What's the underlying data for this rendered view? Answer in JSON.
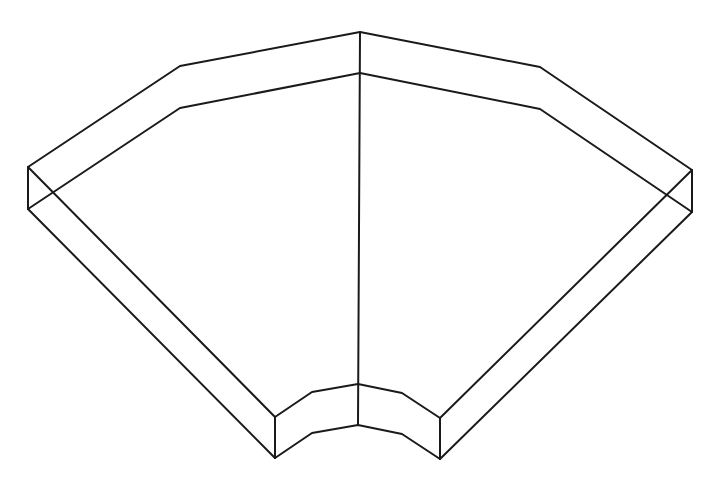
{
  "diagram": {
    "title": "",
    "stroke_color": "#1a1a1a",
    "background": "#ffffff",
    "edges": {
      "outer_top": [
        [
          28,
          167
        ],
        [
          180,
          66
        ],
        [
          360,
          32
        ],
        [
          540,
          67
        ],
        [
          692,
          170
        ]
      ],
      "outer_bottom": [
        [
          28,
          209
        ],
        [
          180,
          108
        ],
        [
          360,
          73
        ],
        [
          540,
          109
        ],
        [
          692,
          212
        ]
      ],
      "inner_top": [
        [
          275,
          417
        ],
        [
          312,
          392
        ],
        [
          358,
          384
        ],
        [
          402,
          393
        ],
        [
          440,
          418
        ]
      ],
      "inner_bottom": [
        [
          275,
          458
        ],
        [
          312,
          433
        ],
        [
          358,
          425
        ],
        [
          402,
          434
        ],
        [
          440,
          459
        ]
      ],
      "left_side_top": [
        [
          28,
          167
        ],
        [
          275,
          417
        ]
      ],
      "left_side_bottom": [
        [
          28,
          209
        ],
        [
          275,
          458
        ]
      ],
      "right_side_top": [
        [
          692,
          170
        ],
        [
          440,
          418
        ]
      ],
      "right_side_bottom": [
        [
          692,
          212
        ],
        [
          440,
          459
        ]
      ],
      "verticals": [
        [
          [
            28,
            167
          ],
          [
            28,
            209
          ]
        ],
        [
          [
            692,
            170
          ],
          [
            692,
            212
          ]
        ],
        [
          [
            275,
            417
          ],
          [
            275,
            458
          ]
        ],
        [
          [
            440,
            418
          ],
          [
            440,
            459
          ]
        ],
        [
          [
            360,
            32
          ],
          [
            358,
            425
          ]
        ]
      ]
    }
  }
}
